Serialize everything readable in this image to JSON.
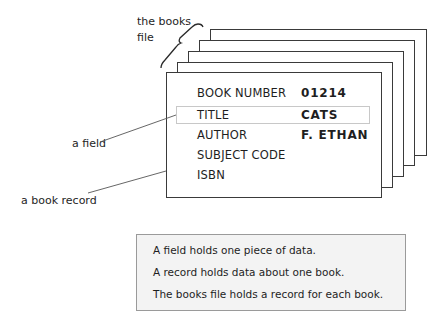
{
  "annotations": {
    "books_file": [
      "the books",
      "file"
    ],
    "field": "a field",
    "book_record": "a book record"
  },
  "record": {
    "fields": [
      {
        "label": "BOOK  NUMBER",
        "value": "01214"
      },
      {
        "label": "TITLE",
        "value": "CATS"
      },
      {
        "label": "AUTHOR",
        "value": "F. ETHAN"
      },
      {
        "label": "SUBJECT CODE",
        "value": ""
      },
      {
        "label": "ISBN",
        "value": ""
      }
    ]
  },
  "stacked_records_count": 5,
  "note": {
    "lines": [
      "A field holds one piece of data.",
      "A record holds data about one book.",
      "The books file holds a record for each book."
    ]
  }
}
